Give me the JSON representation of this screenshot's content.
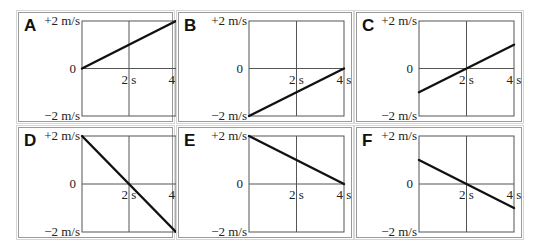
{
  "figure": {
    "axis_labels": {
      "y_top": "+2 m/s",
      "y_zero": "0",
      "y_bottom": "−2 m/s",
      "x_mid": "2 s",
      "x_end": "4 s"
    },
    "axis_ranges": {
      "t": [
        0,
        4
      ],
      "v": [
        -2,
        2
      ]
    },
    "line_color": "#111111",
    "grid_color": "#555555"
  },
  "panels": [
    {
      "letter": "A",
      "start": {
        "t": 0,
        "v": 0
      },
      "end": {
        "t": 4,
        "v": 2
      }
    },
    {
      "letter": "B",
      "start": {
        "t": 0,
        "v": -2
      },
      "end": {
        "t": 4,
        "v": 0
      }
    },
    {
      "letter": "C",
      "start": {
        "t": 0,
        "v": -1
      },
      "end": {
        "t": 4,
        "v": 1
      }
    },
    {
      "letter": "D",
      "start": {
        "t": 0,
        "v": 2
      },
      "end": {
        "t": 4,
        "v": -2
      }
    },
    {
      "letter": "E",
      "start": {
        "t": 0,
        "v": 2
      },
      "end": {
        "t": 4,
        "v": 0
      }
    },
    {
      "letter": "F",
      "start": {
        "t": 0,
        "v": 1
      },
      "end": {
        "t": 4,
        "v": -1
      }
    }
  ]
}
